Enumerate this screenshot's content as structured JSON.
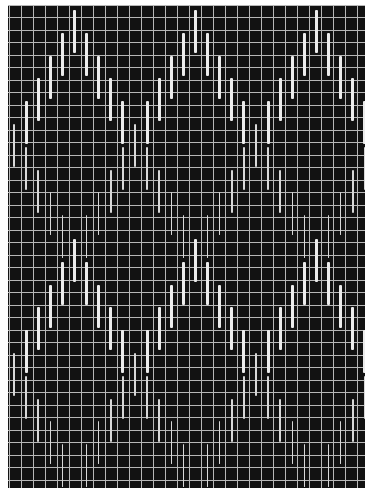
{
  "artwork": {
    "title": "",
    "colors": {
      "background": "#121212",
      "grid": "#b8b8b8",
      "thick_bar": "#ececec",
      "thin_bar": "#d8d8d8",
      "frame": "#ffffff"
    },
    "frame": {
      "left": 8,
      "top": 5,
      "width": 357,
      "height": 483
    },
    "grid": {
      "vertical_x": [
        1,
        13,
        25,
        37,
        49,
        61,
        73,
        85,
        97,
        109,
        121,
        133,
        145,
        157,
        169,
        181,
        193,
        205,
        217,
        229,
        241,
        253,
        265,
        277,
        289,
        301,
        313,
        325,
        337,
        349
      ],
      "horizontal_y": [
        0,
        12,
        25,
        37,
        50,
        62,
        75,
        87,
        100,
        112,
        125,
        137,
        150,
        162,
        175,
        187,
        200,
        212,
        225,
        237,
        250,
        262,
        275,
        287,
        300,
        312,
        325,
        337,
        350,
        362,
        375,
        387,
        400,
        412,
        425,
        437,
        450,
        462,
        475
      ]
    },
    "bar_model": {
      "column_x0": 6,
      "column_step": 12.1,
      "columns": 30,
      "peak_columns": [
        5,
        15,
        25
      ],
      "segment_length": 43,
      "step_dy": 22.8,
      "layers": [
        {
          "name": "upper-thick-band",
          "start": 5,
          "dir": 1,
          "valley_thin": true,
          "skip_peak": false,
          "skip_valley": false
        },
        {
          "name": "upper-thin-band",
          "start": 233,
          "dir": -1,
          "thin": true,
          "skip_peak": true,
          "skip_valley": true
        },
        {
          "name": "lower-thick-band",
          "start": 234,
          "dir": 1,
          "valley_thin": true,
          "skip_peak": false,
          "skip_valley": false
        },
        {
          "name": "lower-thin-band",
          "start": 462,
          "dir": -1,
          "thin": true,
          "skip_peak": true,
          "skip_valley": true
        }
      ]
    }
  }
}
